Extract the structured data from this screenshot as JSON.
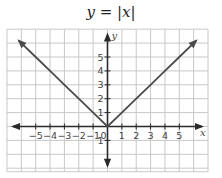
{
  "title": "y = |x|",
  "colors": {
    "grid": "#c8c8c8",
    "axis": "#2a2a2a",
    "line": "#4a4a4a",
    "text": "#444444"
  },
  "chart_data": {
    "type": "line",
    "title": "y = |x|",
    "xlabel": "x",
    "ylabel": "y",
    "xlim": [
      -7,
      7
    ],
    "ylim": [
      -3,
      7
    ],
    "grid": true,
    "x_ticks": [
      -5,
      -4,
      -3,
      -2,
      -1,
      0,
      1,
      2,
      3,
      4,
      5
    ],
    "y_ticks": [
      -1,
      1,
      2,
      3,
      4,
      5
    ],
    "series": [
      {
        "name": "y = |x|",
        "x": [
          -6.2,
          -5,
          -4,
          -3,
          -2,
          -1,
          0,
          1,
          2,
          3,
          4,
          5,
          6.2
        ],
        "y": [
          6.2,
          5,
          4,
          3,
          2,
          1,
          0,
          1,
          2,
          3,
          4,
          5,
          6.2
        ],
        "arrows_at_ends": true
      }
    ]
  }
}
